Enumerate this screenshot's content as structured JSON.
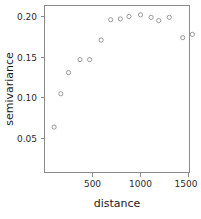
{
  "chart_data": {
    "type": "scatter",
    "title": "",
    "xlabel": "distance",
    "ylabel": "semivariance",
    "xlim": [
      0,
      1520
    ],
    "ylim": [
      0.0,
      0.211
    ],
    "grid": false,
    "legend": null,
    "xticks": [
      500,
      1000,
      1500
    ],
    "xticklabels": [
      "500",
      "1000",
      "1500"
    ],
    "yticks": [
      0.05,
      0.1,
      0.15,
      0.2
    ],
    "yticklabels": [
      "0.05",
      "0.10",
      "0.15",
      "0.20"
    ],
    "marker": "open-circle",
    "marker_color": "#9a9a9a",
    "x": [
      100,
      170,
      250,
      370,
      470,
      590,
      690,
      790,
      880,
      1000,
      1110,
      1190,
      1300,
      1440,
      1540
    ],
    "y": [
      0.064,
      0.105,
      0.131,
      0.147,
      0.147,
      0.171,
      0.196,
      0.197,
      0.2,
      0.202,
      0.199,
      0.195,
      0.199,
      0.174,
      0.178
    ],
    "points": [
      {
        "x": 100,
        "y": 0.064
      },
      {
        "x": 170,
        "y": 0.105
      },
      {
        "x": 250,
        "y": 0.131
      },
      {
        "x": 370,
        "y": 0.147
      },
      {
        "x": 470,
        "y": 0.147
      },
      {
        "x": 590,
        "y": 0.171
      },
      {
        "x": 690,
        "y": 0.196
      },
      {
        "x": 790,
        "y": 0.197
      },
      {
        "x": 880,
        "y": 0.2
      },
      {
        "x": 1000,
        "y": 0.202
      },
      {
        "x": 1110,
        "y": 0.199
      },
      {
        "x": 1190,
        "y": 0.195
      },
      {
        "x": 1300,
        "y": 0.199
      },
      {
        "x": 1440,
        "y": 0.174
      },
      {
        "x": 1540,
        "y": 0.178
      }
    ]
  },
  "axes": {
    "x_axis_label": "distance",
    "y_axis_label": "semivariance"
  }
}
